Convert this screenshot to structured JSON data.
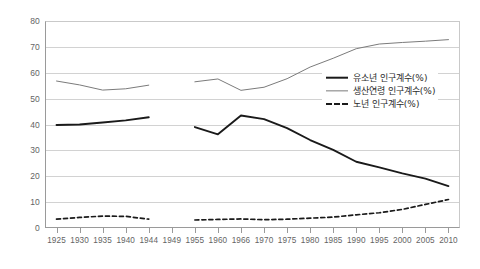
{
  "chart_data": {
    "type": "line",
    "title": "",
    "xlabel": "",
    "ylabel": "",
    "ylim": [
      0,
      80
    ],
    "ytick_step": 10,
    "grid": true,
    "legend_position": "inside-right",
    "categories": [
      "1925",
      "1930",
      "1935",
      "1940",
      "1944",
      "1949",
      "1955",
      "1960",
      "1966",
      "1970",
      "1975",
      "1980",
      "1985",
      "1990",
      "1995",
      "2000",
      "2005",
      "2010"
    ],
    "yticks": [
      "0",
      "10",
      "20",
      "30",
      "40",
      "50",
      "60",
      "70",
      "80"
    ],
    "series": [
      {
        "name": "유소년 인구계수(%)",
        "color": "#1a1a1a",
        "style": "solid-thick",
        "values": [
          39.8,
          40.0,
          40.8,
          41.6,
          42.8,
          null,
          39.0,
          36.2,
          43.5,
          42.1,
          38.6,
          34.0,
          30.2,
          25.6,
          23.4,
          21.1,
          19.1,
          16.2
        ]
      },
      {
        "name": "생산연령 인구계수(%)",
        "color": "#7b7b7b",
        "style": "solid-thin",
        "values": [
          56.8,
          55.3,
          53.3,
          53.8,
          55.2,
          null,
          56.5,
          57.6,
          53.2,
          54.4,
          57.7,
          62.2,
          65.6,
          69.3,
          71.1,
          71.7,
          72.2,
          72.8
        ]
      },
      {
        "name": "노년 인구계수(%)",
        "color": "#1a1a1a",
        "style": "dashed",
        "values": [
          3.4,
          4.1,
          4.6,
          4.5,
          3.4,
          null,
          3.1,
          3.3,
          3.5,
          3.2,
          3.4,
          3.8,
          4.2,
          5.1,
          5.9,
          7.2,
          9.1,
          11.0
        ]
      }
    ]
  },
  "legend": {
    "items": [
      {
        "label": "유소년 인구계수(%)"
      },
      {
        "label": "생산연령 인구계수(%)"
      },
      {
        "label": "노년 인구계수(%)"
      }
    ]
  }
}
